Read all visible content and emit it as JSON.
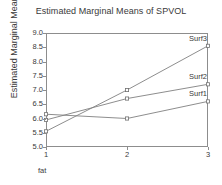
{
  "chart_data": {
    "type": "line",
    "title": "Estimated Marginal Means of SPVOL",
    "xlabel": "fat",
    "ylabel": "Estimated Marginal Means",
    "categories": [
      "1",
      "2",
      "3"
    ],
    "x": [
      1,
      2,
      3
    ],
    "xlim": [
      1,
      3
    ],
    "ylim": [
      5.0,
      9.0
    ],
    "yticks": [
      "9.0",
      "8.5",
      "8.0",
      "7.5",
      "7.0",
      "6.5",
      "6.0",
      "5.5",
      "5.0"
    ],
    "ytick_values": [
      9.0,
      8.5,
      8.0,
      7.5,
      7.0,
      6.5,
      6.0,
      5.5,
      5.0
    ],
    "xticks": [
      "1",
      "2",
      "3"
    ],
    "grid": false,
    "legend": "inline-right-end-labels",
    "line_color": "#808080",
    "marker_color": "#707070",
    "axis_color": "#8d8d8d",
    "text_color": "#3a3a3a",
    "series": [
      {
        "name": "Surf1",
        "values": [
          6.15,
          6.0,
          6.6
        ]
      },
      {
        "name": "Surf2",
        "values": [
          5.95,
          6.7,
          7.2
        ]
      },
      {
        "name": "Surf3",
        "values": [
          5.55,
          7.0,
          8.55
        ]
      }
    ]
  }
}
